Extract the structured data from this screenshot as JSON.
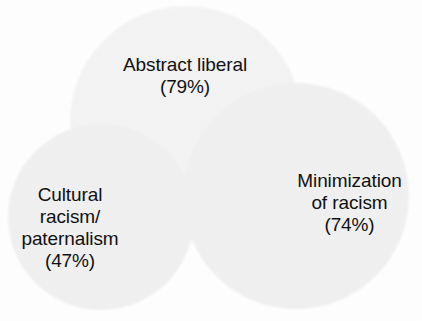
{
  "chart_data": {
    "type": "pie",
    "subtype": "venn-diagram",
    "title": "",
    "subtitle": "",
    "xlabel": "",
    "ylabel": "",
    "grid": false,
    "legend_position": "none",
    "background_color": "#ffffff",
    "text_color": "#111111",
    "circle_fill_color": "#f4f4f4",
    "circle_overlap_color": "#e8e8e8",
    "categories": [
      "Abstract liberal",
      "Cultural racism/paternalism",
      "Minimization of racism"
    ],
    "values": [
      79,
      74,
      47
    ],
    "value_unit": "%",
    "sets": [
      {
        "name": "abstract-liberal",
        "label": "Abstract liberal",
        "value_label": "(79%)",
        "value": 79,
        "cx": 186,
        "cy": 122,
        "r": 116
      },
      {
        "name": "minimization-of-racism",
        "label": "Minimization\nof racism",
        "value_label": "(74%)",
        "value": 74,
        "cx": 296,
        "cy": 196,
        "r": 113
      },
      {
        "name": "cultural-racism-paternalism",
        "label": "Cultural\nracism/\npaternalism",
        "value_label": "(47%)",
        "value": 47,
        "cx": 101,
        "cy": 217,
        "r": 93
      }
    ]
  },
  "labels": {
    "abstract_liberal": "Abstract liberal\n(79%)",
    "cultural_racism_paternalism": "Cultural\nracism/\npaternalism\n(47%)",
    "minimization_of_racism": "Minimization\nof racism\n(74%)"
  }
}
